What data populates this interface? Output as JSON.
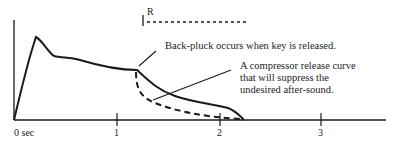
{
  "diagram": {
    "x_axis": {
      "ticks": [
        {
          "label": "0 sec",
          "value": 0
        },
        {
          "label": "1",
          "value": 1
        },
        {
          "label": "2",
          "value": 2
        },
        {
          "label": "3",
          "value": 3
        }
      ]
    },
    "release_marker": {
      "label": "R"
    },
    "annotations": {
      "back_pluck": "Back-pluck occurs when key is released.",
      "compressor_line1": "A compressor release curve",
      "compressor_line2": "that will suppress the",
      "compressor_line3": "undesired after-sound."
    },
    "curves": [
      {
        "name": "envelope",
        "style": "solid"
      },
      {
        "name": "compressor-release",
        "style": "dashed"
      }
    ],
    "colors": {
      "ink": "#1a1a1a",
      "background": "#ffffff"
    }
  }
}
